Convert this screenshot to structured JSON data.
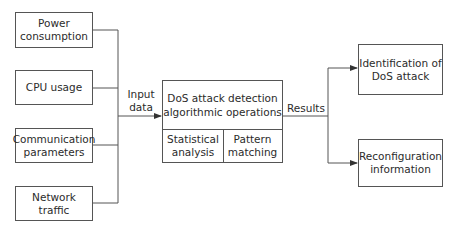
{
  "inputs": [
    {
      "line1": "Power",
      "line2": "consumption"
    },
    {
      "line1": "CPU usage",
      "line2": ""
    },
    {
      "line1": "Communication",
      "line2": "parameters"
    },
    {
      "line1": "Network",
      "line2": "traffic"
    }
  ],
  "input_label": {
    "line1": "Input",
    "line2": "data"
  },
  "main": {
    "title_line1": "DoS attack detection",
    "title_line2": "algorithmic operations",
    "sub_left": {
      "line1": "Statistical",
      "line2": "analysis"
    },
    "sub_right": {
      "line1": "Pattern",
      "line2": "matching"
    }
  },
  "results_label": "Results",
  "outputs": [
    {
      "line1": "Identification of",
      "line2": "DoS attack"
    },
    {
      "line1": "Reconfiguration",
      "line2": "information"
    }
  ],
  "colors": {
    "line": "#555555",
    "text": "#2b2b2b",
    "background": "#ffffff"
  }
}
